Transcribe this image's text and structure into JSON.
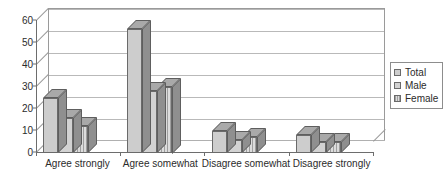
{
  "chart_data": {
    "type": "bar",
    "title": "",
    "subtitle": "",
    "xlabel": "",
    "ylabel": "",
    "ylim": [
      0,
      60
    ],
    "yticks": [
      0,
      10,
      20,
      30,
      40,
      50,
      60
    ],
    "grid": true,
    "three_d": true,
    "legend_position": "right",
    "categories": [
      "Agree strongly",
      "Agree somewhat",
      "Disagree somewhat",
      "Disagree strongly"
    ],
    "series": [
      {
        "name": "Total",
        "values": [
          25,
          56,
          10,
          8
        ]
      },
      {
        "name": "Male",
        "values": [
          16,
          28,
          6,
          5
        ]
      },
      {
        "name": "Female",
        "values": [
          12,
          30,
          7,
          5
        ]
      }
    ]
  },
  "legend": {
    "items": [
      {
        "label": "Total",
        "swatch": "total"
      },
      {
        "label": "Male",
        "swatch": "male"
      },
      {
        "label": "Female",
        "swatch": "female"
      }
    ]
  },
  "colors": {
    "bar_total": "#cdcdcd",
    "bar_male": "#d2d2d2",
    "bar_female": "#dcdcdc",
    "bar_edge": "#6a6a6a",
    "bar_top": "#a9a9a9",
    "bar_side": "#8f8f8f",
    "grid": "#b9b9b9",
    "axis": "#6d6d6d",
    "text": "#2b2b2b",
    "background": "#ffffff"
  }
}
